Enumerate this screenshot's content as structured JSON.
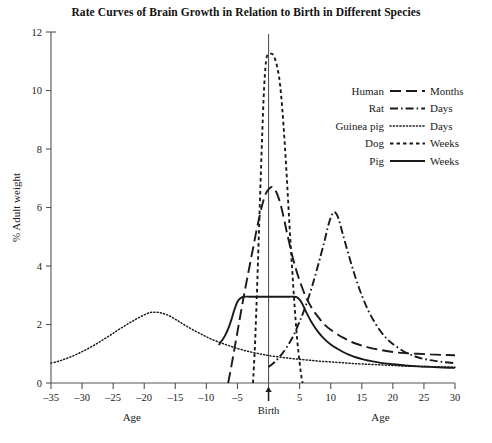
{
  "chart_data": {
    "type": "line",
    "title": "Rate Curves of Brain Growth in Relation to Birth in Different Species",
    "xlabel": "Age",
    "xlabel_right": "Age",
    "ylabel": "% Adult weight",
    "xlim": [
      -35,
      30
    ],
    "ylim": [
      0,
      12
    ],
    "xticks": [
      -35,
      -30,
      -25,
      -20,
      -15,
      -10,
      -5,
      0,
      5,
      10,
      15,
      20,
      25,
      30
    ],
    "xtick_labels": [
      "–35",
      "–30",
      "–25",
      "–20",
      "–15",
      "–10",
      "–5",
      "",
      "5",
      "10",
      "15",
      "20",
      "25",
      "30"
    ],
    "yticks": [
      0,
      2,
      4,
      6,
      8,
      10,
      12
    ],
    "ytick_labels": [
      "0",
      "2",
      "4",
      "6",
      "8",
      "10",
      "12"
    ],
    "grid": false,
    "legend_position": "upper-right",
    "annotations": [
      {
        "name": "birth-marker",
        "label": "Birth",
        "x": 0,
        "note": "vertical reference line at age 0 with up arrow"
      }
    ],
    "series": [
      {
        "name": "Human",
        "unit": "Months",
        "dash": "long-dash",
        "peak": {
          "x": 1.5,
          "y": 6.7
        },
        "points": [
          [
            -6.5,
            0.0
          ],
          [
            -6.0,
            0.55
          ],
          [
            -5.5,
            1.15
          ],
          [
            -5.0,
            1.75
          ],
          [
            -4.5,
            2.35
          ],
          [
            -4.0,
            2.95
          ],
          [
            -3.5,
            3.5
          ],
          [
            -3.0,
            4.05
          ],
          [
            -2.5,
            4.6
          ],
          [
            -2.0,
            5.15
          ],
          [
            -1.5,
            5.65
          ],
          [
            -1.0,
            6.1
          ],
          [
            -0.5,
            6.45
          ],
          [
            0.0,
            6.62
          ],
          [
            0.5,
            6.7
          ],
          [
            1.0,
            6.62
          ],
          [
            1.5,
            6.4
          ],
          [
            2.0,
            6.05
          ],
          [
            2.5,
            5.6
          ],
          [
            3.0,
            5.1
          ],
          [
            4.0,
            4.2
          ],
          [
            5.0,
            3.5
          ],
          [
            6.0,
            2.95
          ],
          [
            7.0,
            2.55
          ],
          [
            8.0,
            2.25
          ],
          [
            9.0,
            2.0
          ],
          [
            10.0,
            1.82
          ],
          [
            12.0,
            1.55
          ],
          [
            14.0,
            1.35
          ],
          [
            16.0,
            1.22
          ],
          [
            18.0,
            1.13
          ],
          [
            20.0,
            1.06
          ],
          [
            22.0,
            1.02
          ],
          [
            24.0,
            1.0
          ],
          [
            26.0,
            0.98
          ],
          [
            28.0,
            0.96
          ],
          [
            30.0,
            0.95
          ]
        ]
      },
      {
        "name": "Rat",
        "unit": "Days",
        "dash": "dash-dot",
        "peak": {
          "x": 10.5,
          "y": 5.85
        },
        "points": [
          [
            0.0,
            0.55
          ],
          [
            1.0,
            0.72
          ],
          [
            2.0,
            0.95
          ],
          [
            3.0,
            1.25
          ],
          [
            4.0,
            1.62
          ],
          [
            5.0,
            2.1
          ],
          [
            6.0,
            2.65
          ],
          [
            7.0,
            3.3
          ],
          [
            8.0,
            4.05
          ],
          [
            9.0,
            4.85
          ],
          [
            9.5,
            5.3
          ],
          [
            10.0,
            5.65
          ],
          [
            10.5,
            5.85
          ],
          [
            11.0,
            5.75
          ],
          [
            11.5,
            5.45
          ],
          [
            12.0,
            5.05
          ],
          [
            13.0,
            4.3
          ],
          [
            14.0,
            3.6
          ],
          [
            15.0,
            3.0
          ],
          [
            16.0,
            2.5
          ],
          [
            17.0,
            2.1
          ],
          [
            18.0,
            1.78
          ],
          [
            19.0,
            1.52
          ],
          [
            20.0,
            1.33
          ],
          [
            22.0,
            1.05
          ],
          [
            24.0,
            0.88
          ],
          [
            26.0,
            0.78
          ],
          [
            28.0,
            0.72
          ],
          [
            30.0,
            0.68
          ]
        ]
      },
      {
        "name": "Guinea pig",
        "unit": "Days",
        "dash": "dotted",
        "peak": {
          "x": -19.0,
          "y": 2.42
        },
        "points": [
          [
            -35.0,
            0.68
          ],
          [
            -34.0,
            0.73
          ],
          [
            -33.0,
            0.8
          ],
          [
            -32.0,
            0.88
          ],
          [
            -31.0,
            0.97
          ],
          [
            -30.0,
            1.07
          ],
          [
            -29.0,
            1.18
          ],
          [
            -28.0,
            1.3
          ],
          [
            -27.0,
            1.43
          ],
          [
            -26.0,
            1.56
          ],
          [
            -25.0,
            1.7
          ],
          [
            -24.0,
            1.84
          ],
          [
            -23.0,
            1.97
          ],
          [
            -22.0,
            2.1
          ],
          [
            -21.0,
            2.22
          ],
          [
            -20.0,
            2.33
          ],
          [
            -19.0,
            2.41
          ],
          [
            -18.0,
            2.42
          ],
          [
            -17.0,
            2.38
          ],
          [
            -16.0,
            2.3
          ],
          [
            -15.0,
            2.18
          ],
          [
            -14.0,
            2.05
          ],
          [
            -13.0,
            1.92
          ],
          [
            -12.0,
            1.8
          ],
          [
            -11.0,
            1.69
          ],
          [
            -10.0,
            1.58
          ],
          [
            -9.0,
            1.48
          ],
          [
            -8.0,
            1.4
          ],
          [
            -7.0,
            1.32
          ],
          [
            -6.0,
            1.25
          ],
          [
            -5.0,
            1.18
          ],
          [
            -4.0,
            1.12
          ],
          [
            -3.0,
            1.07
          ],
          [
            -2.0,
            1.02
          ],
          [
            -1.0,
            0.98
          ],
          [
            0.0,
            0.94
          ],
          [
            2.0,
            0.88
          ],
          [
            4.0,
            0.83
          ],
          [
            6.0,
            0.79
          ],
          [
            8.0,
            0.75
          ],
          [
            10.0,
            0.72
          ],
          [
            12.0,
            0.69
          ],
          [
            14.0,
            0.66
          ],
          [
            16.0,
            0.64
          ],
          [
            18.0,
            0.62
          ],
          [
            20.0,
            0.6
          ],
          [
            22.0,
            0.58
          ],
          [
            24.0,
            0.57
          ],
          [
            26.0,
            0.56
          ],
          [
            28.0,
            0.55
          ],
          [
            30.0,
            0.54
          ]
        ]
      },
      {
        "name": "Dog",
        "unit": "Weeks",
        "dash": "short-dash",
        "peak": {
          "x": 0.6,
          "y": 11.25
        },
        "points": [
          [
            -2.5,
            0.0
          ],
          [
            -2.2,
            1.2
          ],
          [
            -2.0,
            2.3
          ],
          [
            -1.8,
            3.5
          ],
          [
            -1.6,
            4.8
          ],
          [
            -1.4,
            6.1
          ],
          [
            -1.2,
            7.4
          ],
          [
            -1.0,
            8.6
          ],
          [
            -0.8,
            9.7
          ],
          [
            -0.6,
            10.5
          ],
          [
            -0.4,
            11.0
          ],
          [
            -0.2,
            11.2
          ],
          [
            0.2,
            11.25
          ],
          [
            0.6,
            11.25
          ],
          [
            1.0,
            11.1
          ],
          [
            1.4,
            10.8
          ],
          [
            1.8,
            10.3
          ],
          [
            2.2,
            9.4
          ],
          [
            2.6,
            8.2
          ],
          [
            3.0,
            6.8
          ],
          [
            3.4,
            5.3
          ],
          [
            3.8,
            3.9
          ],
          [
            4.2,
            2.6
          ],
          [
            4.6,
            1.5
          ],
          [
            5.0,
            0.7
          ],
          [
            5.3,
            0.2
          ],
          [
            5.5,
            0.0
          ]
        ]
      },
      {
        "name": "Pig",
        "unit": "Weeks",
        "dash": "solid",
        "plateau": {
          "from": -4.0,
          "to": 5.0,
          "y": 2.95
        },
        "points": [
          [
            -8.0,
            1.3
          ],
          [
            -7.5,
            1.45
          ],
          [
            -7.0,
            1.62
          ],
          [
            -6.5,
            1.85
          ],
          [
            -6.0,
            2.15
          ],
          [
            -5.5,
            2.5
          ],
          [
            -5.0,
            2.78
          ],
          [
            -4.5,
            2.9
          ],
          [
            -4.0,
            2.95
          ],
          [
            -3.0,
            2.95
          ],
          [
            -2.0,
            2.95
          ],
          [
            -1.0,
            2.95
          ],
          [
            0.0,
            2.95
          ],
          [
            1.0,
            2.95
          ],
          [
            2.0,
            2.95
          ],
          [
            3.0,
            2.95
          ],
          [
            4.0,
            2.95
          ],
          [
            4.6,
            2.93
          ],
          [
            5.0,
            2.85
          ],
          [
            5.5,
            2.68
          ],
          [
            6.0,
            2.45
          ],
          [
            7.0,
            2.05
          ],
          [
            8.0,
            1.74
          ],
          [
            9.0,
            1.5
          ],
          [
            10.0,
            1.32
          ],
          [
            11.0,
            1.18
          ],
          [
            12.0,
            1.06
          ],
          [
            13.0,
            0.96
          ],
          [
            14.0,
            0.88
          ],
          [
            15.0,
            0.82
          ],
          [
            16.0,
            0.77
          ],
          [
            18.0,
            0.69
          ],
          [
            20.0,
            0.64
          ],
          [
            22.0,
            0.6
          ],
          [
            24.0,
            0.57
          ],
          [
            26.0,
            0.55
          ],
          [
            28.0,
            0.53
          ],
          [
            30.0,
            0.52
          ]
        ]
      }
    ],
    "legend": [
      {
        "label": "Human",
        "unit": "Months",
        "dash": "long-dash"
      },
      {
        "label": "Rat",
        "unit": "Days",
        "dash": "dash-dot"
      },
      {
        "label": "Guinea pig",
        "unit": "Days",
        "dash": "dotted"
      },
      {
        "label": "Dog",
        "unit": "Weeks",
        "dash": "short-dash"
      },
      {
        "label": "Pig",
        "unit": "Weeks",
        "dash": "solid"
      }
    ],
    "colors": {
      "ink": "#1a1a1a",
      "axis": "#555555",
      "background": "#ffffff"
    }
  }
}
